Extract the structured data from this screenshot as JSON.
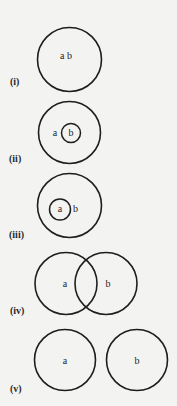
{
  "diagram": {
    "title": "",
    "style": {
      "background": "#f3f3f2",
      "stroke": "#1e1e1e",
      "text": "#1f1f1f"
    },
    "panels": [
      {
        "id": "i",
        "case_label": "(i)",
        "description": "a and b are the same set (a = b)",
        "circles": [
          {
            "cx": 69.5,
            "cy": 59.5,
            "r": 32
          }
        ],
        "labels": [
          {
            "text": "a b",
            "x": 66,
            "y": 57
          }
        ],
        "case_label_pos": {
          "x": 10,
          "y": 83
        }
      },
      {
        "id": "ii",
        "case_label": "(ii)",
        "description": "b is a proper subset of a",
        "circles": [
          {
            "cx": 69.5,
            "cy": 132.5,
            "r": 31
          },
          {
            "cx": 71,
            "cy": 133,
            "r": 9.5
          }
        ],
        "labels": [
          {
            "text": "a",
            "x": 55,
            "y": 134
          },
          {
            "text": "b",
            "x": 71,
            "y": 133.5
          }
        ],
        "case_label_pos": {
          "x": 9,
          "y": 160
        }
      },
      {
        "id": "iii",
        "case_label": "(iii)",
        "description": "a is a proper subset of b",
        "circles": [
          {
            "cx": 69.5,
            "cy": 205.5,
            "r": 32
          },
          {
            "cx": 60,
            "cy": 209.5,
            "r": 10.5
          }
        ],
        "labels": [
          {
            "text": "a",
            "x": 60,
            "y": 210
          },
          {
            "text": "b",
            "x": 75.5,
            "y": 209.5
          }
        ],
        "case_label_pos": {
          "x": 9,
          "y": 236
        }
      },
      {
        "id": "iv",
        "case_label": "(iv)",
        "description": "a and b overlap (partial intersection)",
        "circles": [
          {
            "cx": 66,
            "cy": 283.5,
            "r": 31
          },
          {
            "cx": 106,
            "cy": 283.5,
            "r": 31
          }
        ],
        "labels": [
          {
            "text": "a",
            "x": 65,
            "y": 285
          },
          {
            "text": "b",
            "x": 108,
            "y": 285
          }
        ],
        "case_label_pos": {
          "x": 10,
          "y": 312
        }
      },
      {
        "id": "v",
        "case_label": "(v)",
        "description": "a and b are disjoint",
        "circles": [
          {
            "cx": 65,
            "cy": 360,
            "r": 30.5
          },
          {
            "cx": 137,
            "cy": 360,
            "r": 30.5
          }
        ],
        "labels": [
          {
            "text": "a",
            "x": 65,
            "y": 362
          },
          {
            "text": "b",
            "x": 137,
            "y": 362
          }
        ],
        "case_label_pos": {
          "x": 10,
          "y": 390
        }
      }
    ]
  }
}
